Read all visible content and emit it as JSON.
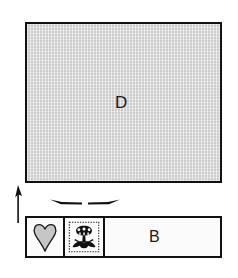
{
  "figure": {
    "background_color": "#ffffff",
    "line_color": "#111111",
    "fill_gray": "#cccccc"
  },
  "panels": {
    "upper": {
      "label": "D",
      "name": "panel-d",
      "fill": "#cccccc",
      "outline": "#111111"
    },
    "lower": {
      "label": "B",
      "name": "band-b",
      "fill": "#cccccc",
      "outline": "#111111",
      "cells": [
        {
          "motif": "heart",
          "motif_icon": "heart-icon",
          "fill": "#fbfbfb",
          "motif_fill": "#c6c6c6"
        },
        {
          "motif": "rosette",
          "motif_icon": "flower-rosette-icon",
          "fill": "#fbfbfb",
          "motif_fill": "#1a1a1a"
        },
        {
          "motif": "plain",
          "motif_icon": "none",
          "fill": "#cccccc",
          "label": "B"
        }
      ]
    }
  },
  "annotations": {
    "height_arrow": {
      "icon": "arrow-up-icon",
      "direction": "up",
      "label": ""
    },
    "width_arrows": {
      "icon": "arrows-horizontal-icon",
      "direction": "left-right",
      "label": ""
    }
  }
}
